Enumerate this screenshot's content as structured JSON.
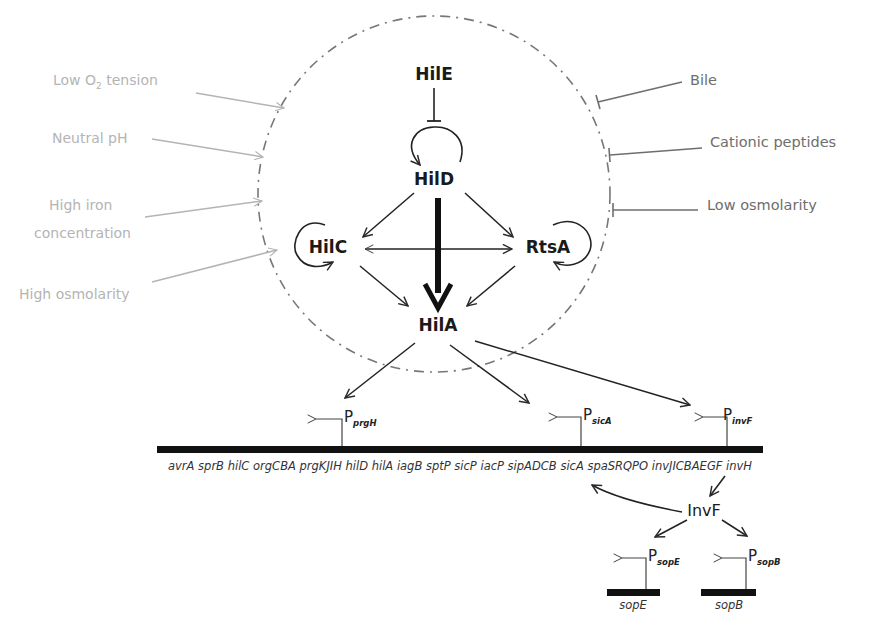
{
  "diagram": {
    "type": "gene-regulatory-network",
    "colors": {
      "activator_signal": "#b4b4b4",
      "repressor_signal": "#6e6e6e",
      "regulator": "#1a1a1a",
      "dna_bar": "#111111",
      "circle_border": "#777777"
    },
    "positive_signals": [
      {
        "id": "low-o2",
        "label_main": "Low O",
        "label_sub": "2",
        "label_tail": " tension"
      },
      {
        "id": "neutral-ph",
        "label": "Neutral pH"
      },
      {
        "id": "high-iron",
        "label_line1": "High iron",
        "label_line2": "concentration"
      },
      {
        "id": "high-osmolarity",
        "label": "High osmolarity"
      }
    ],
    "negative_signals": [
      {
        "id": "bile",
        "label": "Bile"
      },
      {
        "id": "cationic-peptides",
        "label": "Cationic peptides"
      },
      {
        "id": "low-osmolarity",
        "label": "Low osmolarity"
      }
    ],
    "regulators": {
      "hile": "HilE",
      "hild": "HilD",
      "hilc": "HilC",
      "rtsa": "RtsA",
      "hila": "HilA",
      "invf": "InvF"
    },
    "promoters": [
      {
        "id": "prgH",
        "main": "P",
        "sub": "prgH"
      },
      {
        "id": "sicA",
        "main": "P",
        "sub": "sicA"
      },
      {
        "id": "invF",
        "main": "P",
        "sub": "invF"
      },
      {
        "id": "sopE",
        "main": "P",
        "sub": "sopE"
      },
      {
        "id": "sopB",
        "main": "P",
        "sub": "sopB"
      }
    ],
    "spi1_genes": "avrA sprB hilC orgCBA prgKJIH hilD hilA iagB sptP sicP iacP sipADCB sicA spaSRQPO invJICBAEGF invH",
    "effector_genes": {
      "sope": "sopE",
      "sopb": "sopB"
    },
    "interactions": [
      {
        "from": "Low O2 tension",
        "to": "network",
        "type": "activation"
      },
      {
        "from": "Neutral pH",
        "to": "network",
        "type": "activation"
      },
      {
        "from": "High iron concentration",
        "to": "network",
        "type": "activation"
      },
      {
        "from": "High osmolarity",
        "to": "network",
        "type": "activation"
      },
      {
        "from": "Bile",
        "to": "network",
        "type": "repression"
      },
      {
        "from": "Cationic peptides",
        "to": "network",
        "type": "repression"
      },
      {
        "from": "Low osmolarity",
        "to": "network",
        "type": "repression"
      },
      {
        "from": "HilE",
        "to": "HilD",
        "type": "repression"
      },
      {
        "from": "HilD",
        "to": "HilD",
        "type": "autoactivation"
      },
      {
        "from": "HilC",
        "to": "HilC",
        "type": "autoactivation"
      },
      {
        "from": "RtsA",
        "to": "RtsA",
        "type": "autoactivation"
      },
      {
        "from": "HilD",
        "to": "HilC",
        "type": "activation"
      },
      {
        "from": "HilD",
        "to": "RtsA",
        "type": "activation"
      },
      {
        "from": "HilC",
        "to": "RtsA",
        "type": "mutual-activation"
      },
      {
        "from": "HilD",
        "to": "HilA",
        "type": "strong-activation"
      },
      {
        "from": "HilC",
        "to": "HilA",
        "type": "activation"
      },
      {
        "from": "RtsA",
        "to": "HilA",
        "type": "activation"
      },
      {
        "from": "HilA",
        "to": "PprgH",
        "type": "activation"
      },
      {
        "from": "HilA",
        "to": "PsicA",
        "type": "activation"
      },
      {
        "from": "HilA",
        "to": "PinvF",
        "type": "activation"
      },
      {
        "from": "invF gene",
        "to": "InvF",
        "type": "expression"
      },
      {
        "from": "InvF",
        "to": "PsicA",
        "type": "activation"
      },
      {
        "from": "InvF",
        "to": "PsopE",
        "type": "activation"
      },
      {
        "from": "InvF",
        "to": "PsopB",
        "type": "activation"
      }
    ]
  }
}
